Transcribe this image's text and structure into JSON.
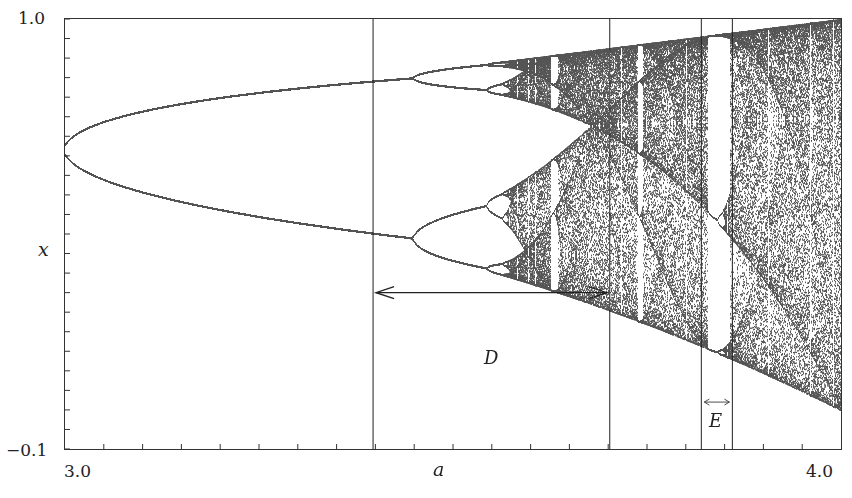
{
  "chart_data": {
    "type": "scatter",
    "title": "",
    "subtitle": "Bifurcation diagram of the logistic map x -> a x (1 - x)",
    "xlabel": "a",
    "ylabel": "x",
    "xlim": [
      3.0,
      4.0
    ],
    "ylim": [
      -0.1,
      1.0
    ],
    "x_tick_labels": [
      "3.0",
      "4.0"
    ],
    "y_tick_labels": [
      "1.0",
      "-0.1"
    ],
    "minor_ticks": {
      "x_count": 19,
      "y_step": 0.05
    },
    "grid": false,
    "legend": null,
    "point_color": "#555555",
    "series": [
      {
        "name": "attractor",
        "map": "logistic",
        "a_start": 3.0,
        "a_end": 4.0,
        "transient": 300,
        "samples_per_a": 200
      }
    ],
    "features": [
      {
        "label": "period-2 branch start",
        "a": 3.0,
        "x": 0.667
      },
      {
        "label": "period-4 bifurcation",
        "a": 3.449,
        "x_values": [
          0.44,
          0.85
        ]
      },
      {
        "label": "onset of chaos",
        "a": 3.57
      },
      {
        "label": "period-3 window",
        "a_range": [
          3.828,
          3.857
        ]
      }
    ],
    "vertical_lines": [
      3.397,
      3.702,
      3.82,
      3.86
    ],
    "annotations": [
      {
        "text": "D",
        "type": "double-arrow",
        "a_from": 3.397,
        "a_to": 3.702,
        "x": 0.3
      },
      {
        "text": "E",
        "type": "double-arrow",
        "a_from": 3.82,
        "a_to": 3.86,
        "x": 0.02
      }
    ]
  },
  "labels": {
    "y_top": "1.0",
    "y_bottom": "−0.1",
    "y_axis": "x",
    "x_left": "3.0",
    "x_right": "4.0",
    "x_axis": "a",
    "region_d": "D",
    "region_e": "E"
  }
}
